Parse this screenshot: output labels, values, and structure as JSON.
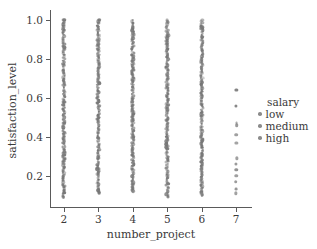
{
  "chart_data": {
    "type": "scatter",
    "title": "",
    "xlabel": "number_project",
    "ylabel": "satisfaction_level",
    "xlim": [
      1.6,
      7.4
    ],
    "ylim": [
      0.04,
      1.04
    ],
    "grid": false,
    "xticks": [
      "2",
      "3",
      "4",
      "5",
      "6",
      "7"
    ],
    "xtick_values": [
      2,
      3,
      4,
      5,
      6,
      7
    ],
    "yticks": [
      "0.2",
      "0.4",
      "0.6",
      "0.8",
      "1.0"
    ],
    "ytick_values": [
      0.2,
      0.4,
      0.6,
      0.8,
      1.0
    ],
    "legend": {
      "title": "salary",
      "position": "right",
      "entries": [
        {
          "label": "low",
          "color": "#8c8c8c"
        },
        {
          "label": "medium",
          "color": "#8c8c8c"
        },
        {
          "label": "high",
          "color": "#8c8c8c"
        }
      ]
    },
    "marker_color": "#777777",
    "columns": [
      {
        "x": 2,
        "y_min": 0.09,
        "y_max": 1.0,
        "dense": true,
        "n_points": 118
      },
      {
        "x": 3,
        "y_min": 0.11,
        "y_max": 1.0,
        "dense": true,
        "n_points": 116
      },
      {
        "x": 4,
        "y_min": 0.12,
        "y_max": 1.0,
        "dense": true,
        "n_points": 114
      },
      {
        "x": 5,
        "y_min": 0.09,
        "y_max": 1.0,
        "dense": true,
        "n_points": 118
      },
      {
        "x": 6,
        "y_min": 0.1,
        "y_max": 1.0,
        "dense": true,
        "n_points": 116
      },
      {
        "x": 7,
        "y_min": 0.1,
        "y_max": 0.64,
        "dense": false,
        "n_points": 12,
        "values": [
          0.64,
          0.56,
          0.47,
          0.46,
          0.41,
          0.37,
          0.29,
          0.26,
          0.23,
          0.2,
          0.17,
          0.13,
          0.11
        ]
      }
    ]
  }
}
